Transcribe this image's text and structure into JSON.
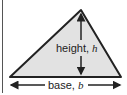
{
  "diagram": {
    "shape": "triangle",
    "fill_color": "#e2e2e2",
    "stroke_color": "#222222",
    "height_label": {
      "text": "height, ",
      "var": "h"
    },
    "base_label": {
      "text": "base, ",
      "var": "b"
    }
  }
}
